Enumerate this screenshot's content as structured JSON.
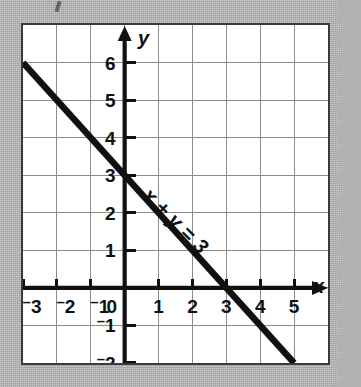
{
  "figure": {
    "kind": "coordinate-grid-graph",
    "background_color": "#b2b2b2",
    "plot_background_color": "#ffffff",
    "frame_color": "#3a3a3a",
    "grid_color": "#8c8c8c",
    "axis_color": "#111111",
    "line_color": "#111111"
  },
  "axes": {
    "x_axis_name": "x",
    "y_axis_name": "y",
    "x_ticks": [
      "⁻3",
      "⁻2",
      "⁻1",
      "0",
      "1",
      "2",
      "3",
      "4",
      "5"
    ],
    "y_ticks": [
      "6",
      "5",
      "4",
      "3",
      "2",
      "1",
      "0",
      "⁻1",
      "⁻2"
    ],
    "origin_label": "0"
  },
  "annotations": {
    "equation_label": "x + y = 3"
  },
  "chart_data": {
    "type": "line",
    "title": "",
    "subtitle": "",
    "xlabel": "x",
    "ylabel": "y",
    "xlim": [
      -3,
      5
    ],
    "ylim": [
      -2,
      6
    ],
    "xticks": [
      -3,
      -2,
      -1,
      0,
      1,
      2,
      3,
      4,
      5
    ],
    "yticks": [
      -2,
      -1,
      0,
      1,
      2,
      3,
      4,
      5,
      6
    ],
    "grid": true,
    "legend": "none",
    "series": [
      {
        "name": "x + y = 3",
        "equation": "x + y = 3",
        "slope": -1,
        "y_intercept": 3,
        "x_intercept": 3,
        "x": [
          -3,
          5
        ],
        "values": [
          6,
          -2
        ],
        "points": [
          [
            -3,
            6
          ],
          [
            0,
            3
          ],
          [
            3,
            0
          ],
          [
            5,
            -2
          ]
        ],
        "label_text": "x + y = 3",
        "label_at": [
          1.35,
          1.65
        ],
        "label_rotation_deg": 45
      }
    ]
  }
}
